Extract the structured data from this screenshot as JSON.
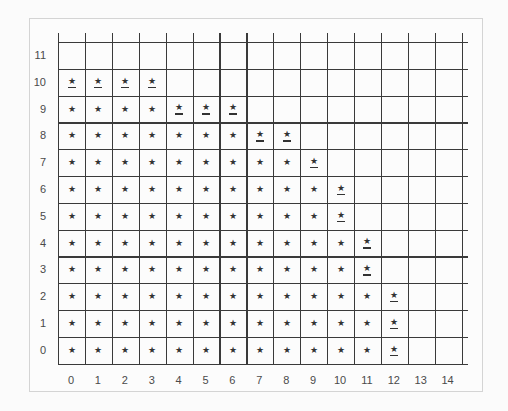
{
  "chart_data": {
    "type": "table",
    "title": "",
    "xlabel": "",
    "ylabel": "",
    "x_ticks": [
      "0",
      "1",
      "2",
      "3",
      "4",
      "5",
      "6",
      "7",
      "8",
      "9",
      "10",
      "11",
      "12",
      "13",
      "14"
    ],
    "y_ticks": [
      "0",
      "1",
      "2",
      "3",
      "4",
      "5",
      "6",
      "7",
      "8",
      "9",
      "10",
      "11"
    ],
    "grid": true,
    "marker": "★",
    "rows": [
      {
        "y": 11,
        "filled_cols": [],
        "underlined_cols": []
      },
      {
        "y": 10,
        "filled_cols": [
          0,
          1,
          2,
          3
        ],
        "underlined_cols": [
          0,
          1,
          2,
          3
        ]
      },
      {
        "y": 9,
        "filled_cols": [
          0,
          1,
          2,
          3,
          4,
          5,
          6
        ],
        "underlined_cols": [
          4,
          5,
          6
        ]
      },
      {
        "y": 8,
        "filled_cols": [
          0,
          1,
          2,
          3,
          4,
          5,
          6,
          7,
          8
        ],
        "underlined_cols": [
          7,
          8
        ]
      },
      {
        "y": 7,
        "filled_cols": [
          0,
          1,
          2,
          3,
          4,
          5,
          6,
          7,
          8,
          9
        ],
        "underlined_cols": [
          9
        ]
      },
      {
        "y": 6,
        "filled_cols": [
          0,
          1,
          2,
          3,
          4,
          5,
          6,
          7,
          8,
          9,
          10
        ],
        "underlined_cols": [
          10
        ]
      },
      {
        "y": 5,
        "filled_cols": [
          0,
          1,
          2,
          3,
          4,
          5,
          6,
          7,
          8,
          9,
          10
        ],
        "underlined_cols": [
          10
        ]
      },
      {
        "y": 4,
        "filled_cols": [
          0,
          1,
          2,
          3,
          4,
          5,
          6,
          7,
          8,
          9,
          10,
          11
        ],
        "underlined_cols": [
          11
        ]
      },
      {
        "y": 3,
        "filled_cols": [
          0,
          1,
          2,
          3,
          4,
          5,
          6,
          7,
          8,
          9,
          10,
          11
        ],
        "underlined_cols": [
          11
        ]
      },
      {
        "y": 2,
        "filled_cols": [
          0,
          1,
          2,
          3,
          4,
          5,
          6,
          7,
          8,
          9,
          10,
          11,
          12
        ],
        "underlined_cols": [
          12
        ]
      },
      {
        "y": 1,
        "filled_cols": [
          0,
          1,
          2,
          3,
          4,
          5,
          6,
          7,
          8,
          9,
          10,
          11,
          12
        ],
        "underlined_cols": [
          12
        ]
      },
      {
        "y": 0,
        "filled_cols": [
          0,
          1,
          2,
          3,
          4,
          5,
          6,
          7,
          8,
          9,
          10,
          11,
          12
        ],
        "underlined_cols": [
          12
        ]
      }
    ],
    "row_lengths": {
      "0": 13,
      "1": 13,
      "2": 13,
      "3": 12,
      "4": 12,
      "5": 11,
      "6": 11,
      "7": 10,
      "8": 9,
      "9": 7,
      "10": 4,
      "11": 0
    }
  },
  "colors": {
    "line": "#3a3a3a",
    "marker": "#333333",
    "label": "#4a4a4a",
    "frame": "#d4d4d4"
  }
}
